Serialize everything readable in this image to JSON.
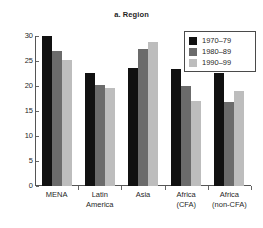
{
  "chart_data": {
    "type": "bar",
    "title": "a. Region",
    "xlabel": "",
    "ylabel": "",
    "ylim": [
      0,
      30
    ],
    "yticks": [
      0,
      5,
      10,
      15,
      20,
      25,
      30
    ],
    "grid": false,
    "legend_position": "top-right",
    "categories": [
      "MENA",
      "Latin America",
      "Asia",
      "Africa (CFA)",
      "Africa (non-CFA)"
    ],
    "category_lines": [
      [
        "MENA"
      ],
      [
        "Latin",
        "America"
      ],
      [
        "Asia"
      ],
      [
        "Africa",
        "(CFA)"
      ],
      [
        "Africa",
        "(non-CFA)"
      ]
    ],
    "series": [
      {
        "name": "1970–79",
        "color": "#111111",
        "values": [
          30.0,
          22.6,
          23.7,
          23.5,
          22.6
        ]
      },
      {
        "name": "1980–89",
        "color": "#6b6b6b",
        "values": [
          27.0,
          20.2,
          27.5,
          20.1,
          16.9
        ]
      },
      {
        "name": "1990–99",
        "color": "#bdbdbd",
        "values": [
          25.3,
          19.7,
          28.8,
          17.0,
          19.0
        ]
      }
    ]
  }
}
